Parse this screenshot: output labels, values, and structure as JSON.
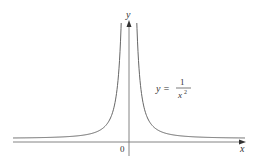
{
  "chart_data": {
    "type": "line",
    "title": "",
    "function": "y = 1/x^2",
    "xlabel": "x",
    "ylabel": "y",
    "origin_label": "0",
    "annotation": {
      "lhs": "y =",
      "numerator": "1",
      "denominator": "x",
      "exponent": "2"
    },
    "series": [
      {
        "name": "y = 1/x^2",
        "branches": [
          "x<0",
          "x>0"
        ]
      }
    ],
    "asymptotes": {
      "vertical": "x = 0",
      "horizontal": "y = 0"
    },
    "grid": false,
    "legend": "none",
    "colors": {
      "curve": "#555555",
      "axis": "#666666",
      "text": "#333333"
    }
  }
}
